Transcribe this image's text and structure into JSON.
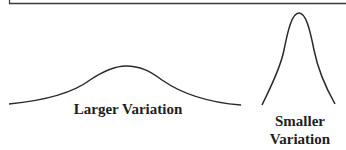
{
  "diagram": {
    "type": "variation-comparison",
    "colors": {
      "stroke": "#2a2a2a",
      "text": "#1e1e1e",
      "background": "#ffffff"
    },
    "curves": [
      {
        "name": "larger-variation-curve",
        "shape": "wide-low-bell-curve",
        "label": "Larger Variation"
      },
      {
        "name": "smaller-variation-curve",
        "shape": "narrow-tall-bell-curve",
        "label_line1": "Smaller",
        "label_line2": "Variation"
      }
    ]
  }
}
